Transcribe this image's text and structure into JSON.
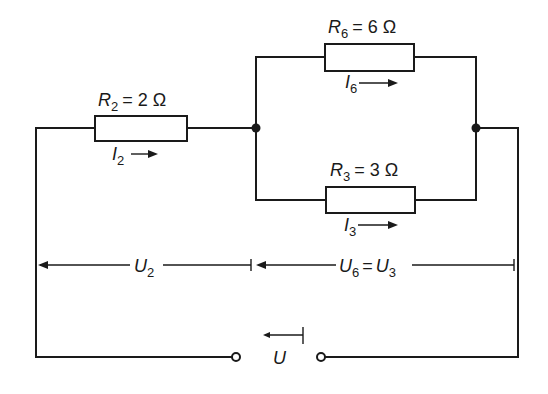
{
  "diagram": {
    "type": "electrical-circuit",
    "stroke_color": "#1a1a1a",
    "background": "#ffffff"
  },
  "resistors": {
    "r2": {
      "symbol": "R",
      "subscript": "2",
      "value_text": "= 2 Ω",
      "current_symbol": "I",
      "current_subscript": "2"
    },
    "r6": {
      "symbol": "R",
      "subscript": "6",
      "value_text": "= 6 Ω",
      "current_symbol": "I",
      "current_subscript": "6"
    },
    "r3": {
      "symbol": "R",
      "subscript": "3",
      "value_text": "= 3 Ω",
      "current_symbol": "I",
      "current_subscript": "3"
    }
  },
  "voltages": {
    "u2": {
      "symbol": "U",
      "subscript": "2"
    },
    "u6_u3": {
      "symbol_a": "U",
      "subscript_a": "6",
      "equals": "=",
      "symbol_b": "U",
      "subscript_b": "3"
    },
    "source": {
      "symbol": "U"
    }
  }
}
